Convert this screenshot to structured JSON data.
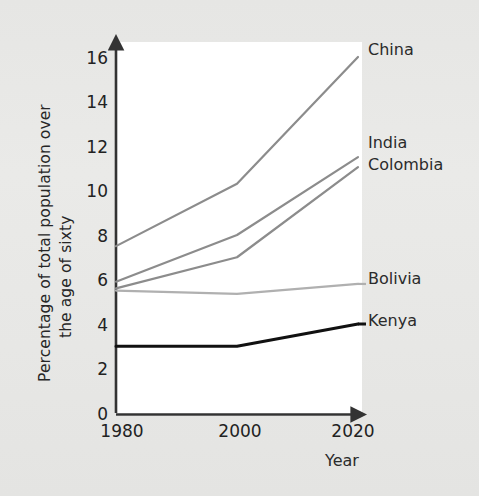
{
  "chart_data": {
    "type": "line",
    "title": "",
    "xlabel": "Year",
    "ylabel": "Percentage of total population over the age of sixty",
    "ylabel_line1": "Percentage of total population over",
    "ylabel_line2": "the age of sixty",
    "x": [
      1980,
      2000,
      2020
    ],
    "xticklabels": [
      "1980",
      "2000",
      "2020"
    ],
    "yticks": [
      0,
      2,
      4,
      6,
      8,
      10,
      12,
      14,
      16
    ],
    "yticklabels": [
      "0",
      "2",
      "4",
      "6",
      "8",
      "10",
      "12",
      "14",
      "16"
    ],
    "xlim": [
      1980,
      2020
    ],
    "ylim": [
      0,
      16
    ],
    "grid": false,
    "legend_position": "right-of-axes-inline",
    "series": [
      {
        "name": "China",
        "values": [
          7.5,
          10.3,
          16.0
        ],
        "color": "#8c8c8c"
      },
      {
        "name": "India",
        "values": [
          5.9,
          8.0,
          11.5
        ],
        "color": "#8c8c8c"
      },
      {
        "name": "Colombia",
        "values": [
          5.6,
          7.0,
          11.05
        ],
        "color": "#8c8c8c"
      },
      {
        "name": "Bolivia",
        "values": [
          5.5,
          5.35,
          5.8
        ],
        "color": "#b0b0b0"
      },
      {
        "name": "Kenya",
        "values": [
          3.0,
          3.0,
          4.0
        ],
        "color": "#111111"
      }
    ]
  },
  "axes": {
    "y_axis_name": "y-axis",
    "x_axis_name": "x-axis",
    "axis_color": "#333333"
  }
}
